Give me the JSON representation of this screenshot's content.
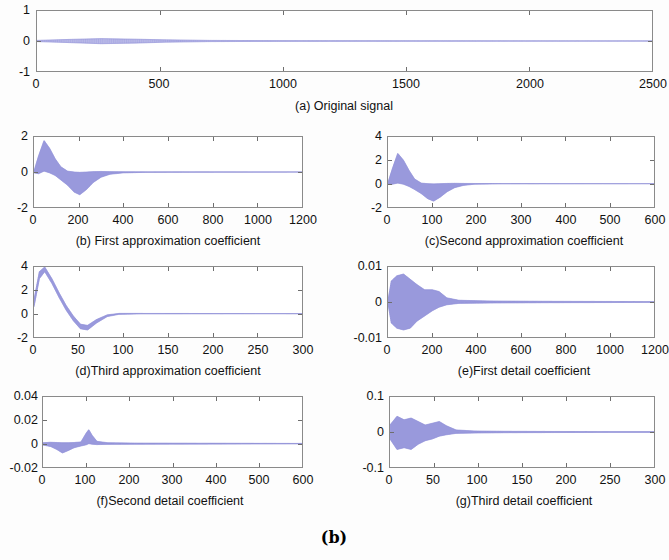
{
  "figure": {
    "panel_letter": "(b)",
    "trace_color": "#8f8fd8",
    "axis_color": "#8a8a8a"
  },
  "chart_data": [
    {
      "id": "a",
      "type": "line",
      "title": "(a) Original signal",
      "xlabel": "",
      "ylabel": "",
      "xlim": [
        0,
        2500
      ],
      "ylim": [
        -1,
        1
      ],
      "xticks": [
        0,
        500,
        1000,
        1500,
        2000,
        2500
      ],
      "yticks": [
        -1,
        0,
        1
      ],
      "grid": false,
      "description": "Near-flat low-amplitude signal centred on zero across full record",
      "envelope": [
        {
          "x": 0,
          "hi": 0.02,
          "lo": -0.02
        },
        {
          "x": 120,
          "hi": 0.05,
          "lo": -0.05
        },
        {
          "x": 260,
          "hi": 0.08,
          "lo": -0.09
        },
        {
          "x": 400,
          "hi": 0.06,
          "lo": -0.07
        },
        {
          "x": 520,
          "hi": 0.04,
          "lo": -0.04
        },
        {
          "x": 700,
          "hi": 0.02,
          "lo": -0.02
        },
        {
          "x": 1000,
          "hi": 0.012,
          "lo": -0.012
        },
        {
          "x": 1500,
          "hi": 0.008,
          "lo": -0.008
        },
        {
          "x": 2000,
          "hi": 0.005,
          "lo": -0.005
        },
        {
          "x": 2500,
          "hi": 0.003,
          "lo": -0.003
        }
      ]
    },
    {
      "id": "b",
      "type": "line",
      "title": "(b) First approximation coefficient",
      "xlabel": "",
      "ylabel": "",
      "xlim": [
        0,
        1200
      ],
      "ylim": [
        -2,
        2
      ],
      "xticks": [
        0,
        200,
        400,
        600,
        800,
        1000,
        1200
      ],
      "yticks": [
        -2,
        0,
        2
      ],
      "grid": false,
      "description": "Dense oscillation: positive lobe peaking near 1.8 around x=50, negative lobe reaching -1.3 near x=200, decaying to zero past x=350",
      "envelope": [
        {
          "x": 0,
          "hi": 0.05,
          "lo": -0.05
        },
        {
          "x": 20,
          "hi": 0.9,
          "lo": -0.1
        },
        {
          "x": 45,
          "hi": 1.8,
          "lo": 0.05
        },
        {
          "x": 70,
          "hi": 1.35,
          "lo": -0.05
        },
        {
          "x": 95,
          "hi": 0.75,
          "lo": -0.2
        },
        {
          "x": 120,
          "hi": 0.3,
          "lo": -0.45
        },
        {
          "x": 150,
          "hi": 0.05,
          "lo": -0.75
        },
        {
          "x": 180,
          "hi": 0.0,
          "lo": -1.15
        },
        {
          "x": 205,
          "hi": -0.02,
          "lo": -1.3
        },
        {
          "x": 235,
          "hi": 0.0,
          "lo": -1.0
        },
        {
          "x": 265,
          "hi": 0.02,
          "lo": -0.6
        },
        {
          "x": 300,
          "hi": 0.03,
          "lo": -0.3
        },
        {
          "x": 340,
          "hi": 0.02,
          "lo": -0.13
        },
        {
          "x": 400,
          "hi": 0.015,
          "lo": -0.05
        },
        {
          "x": 500,
          "hi": 0.01,
          "lo": -0.02
        },
        {
          "x": 700,
          "hi": 0.008,
          "lo": -0.012
        },
        {
          "x": 1000,
          "hi": 0.005,
          "lo": -0.008
        },
        {
          "x": 1200,
          "hi": 0.004,
          "lo": -0.005
        }
      ]
    },
    {
      "id": "c",
      "type": "line",
      "title": "(c)Second approximation coefficient",
      "xlabel": "",
      "ylabel": "",
      "xlim": [
        0,
        600
      ],
      "ylim": [
        -2,
        4
      ],
      "xticks": [
        0,
        100,
        200,
        300,
        400,
        500,
        600
      ],
      "yticks": [
        -2,
        0,
        2,
        4
      ],
      "grid": false,
      "description": "Dense oscillation: positive lobe peaking near 2.6 around x=25, negative lobe reaching -1.5 near x=100, decaying to zero past x=190",
      "envelope": [
        {
          "x": 0,
          "hi": 0.1,
          "lo": -0.05
        },
        {
          "x": 10,
          "hi": 1.3,
          "lo": -0.05
        },
        {
          "x": 22,
          "hi": 2.6,
          "lo": 0.05
        },
        {
          "x": 35,
          "hi": 2.0,
          "lo": -0.05
        },
        {
          "x": 48,
          "hi": 1.1,
          "lo": -0.25
        },
        {
          "x": 60,
          "hi": 0.4,
          "lo": -0.5
        },
        {
          "x": 75,
          "hi": 0.05,
          "lo": -0.85
        },
        {
          "x": 90,
          "hi": 0.0,
          "lo": -1.3
        },
        {
          "x": 103,
          "hi": -0.02,
          "lo": -1.5
        },
        {
          "x": 118,
          "hi": 0.0,
          "lo": -1.15
        },
        {
          "x": 133,
          "hi": 0.02,
          "lo": -0.7
        },
        {
          "x": 150,
          "hi": 0.03,
          "lo": -0.35
        },
        {
          "x": 170,
          "hi": 0.02,
          "lo": -0.15
        },
        {
          "x": 195,
          "hi": 0.015,
          "lo": -0.05
        },
        {
          "x": 250,
          "hi": 0.01,
          "lo": -0.02
        },
        {
          "x": 350,
          "hi": 0.008,
          "lo": -0.012
        },
        {
          "x": 500,
          "hi": 0.005,
          "lo": -0.008
        },
        {
          "x": 600,
          "hi": 0.004,
          "lo": -0.005
        }
      ]
    },
    {
      "id": "d",
      "type": "line",
      "title": "(d)Third approximation coefficient",
      "xlabel": "",
      "ylabel": "",
      "xlim": [
        0,
        300
      ],
      "ylim": [
        -2,
        4
      ],
      "xticks": [
        0,
        50,
        100,
        150,
        200,
        250,
        300
      ],
      "yticks": [
        -2,
        0,
        2,
        4
      ],
      "grid": false,
      "description": "Single large lobe rising off the top of the axis near x=10 then decaying through zero near x=40 to a shallow minimum, flat afterwards",
      "envelope": [
        {
          "x": 0,
          "hi": 1.2,
          "lo": 0.6
        },
        {
          "x": 6,
          "hi": 3.6,
          "lo": 3.0
        },
        {
          "x": 12,
          "hi": 4.0,
          "lo": 3.6
        },
        {
          "x": 20,
          "hi": 3.0,
          "lo": 2.6
        },
        {
          "x": 28,
          "hi": 1.8,
          "lo": 1.4
        },
        {
          "x": 36,
          "hi": 0.7,
          "lo": 0.3
        },
        {
          "x": 44,
          "hi": -0.2,
          "lo": -0.6
        },
        {
          "x": 52,
          "hi": -0.9,
          "lo": -1.3
        },
        {
          "x": 60,
          "hi": -1.0,
          "lo": -1.4
        },
        {
          "x": 70,
          "hi": -0.5,
          "lo": -0.8
        },
        {
          "x": 82,
          "hi": -0.1,
          "lo": -0.25
        },
        {
          "x": 95,
          "hi": 0.02,
          "lo": -0.06
        },
        {
          "x": 120,
          "hi": 0.02,
          "lo": -0.02
        },
        {
          "x": 180,
          "hi": 0.015,
          "lo": -0.015
        },
        {
          "x": 250,
          "hi": 0.01,
          "lo": -0.01
        },
        {
          "x": 300,
          "hi": 0.008,
          "lo": -0.008
        }
      ]
    },
    {
      "id": "e",
      "type": "line",
      "title": "(e)First detail coefficient",
      "xlabel": "",
      "ylabel": "",
      "xlim": [
        0,
        1200
      ],
      "ylim": [
        -0.01,
        0.01
      ],
      "xticks": [
        0,
        200,
        400,
        600,
        800,
        1000,
        1200
      ],
      "yticks": [
        -0.01,
        0,
        0.01
      ],
      "grid": false,
      "description": "Faint high-frequency burst confined to roughly x<260, amplitude up to about 0.008, flat zero thereafter",
      "envelope": [
        {
          "x": 0,
          "hi": 0.0005,
          "lo": -0.0005
        },
        {
          "x": 15,
          "hi": 0.006,
          "lo": -0.006
        },
        {
          "x": 40,
          "hi": 0.0075,
          "lo": -0.0075
        },
        {
          "x": 70,
          "hi": 0.008,
          "lo": -0.008
        },
        {
          "x": 100,
          "hi": 0.0065,
          "lo": -0.0075
        },
        {
          "x": 130,
          "hi": 0.005,
          "lo": -0.0055
        },
        {
          "x": 165,
          "hi": 0.0035,
          "lo": -0.004
        },
        {
          "x": 200,
          "hi": 0.0035,
          "lo": -0.0025
        },
        {
          "x": 230,
          "hi": 0.003,
          "lo": -0.0015
        },
        {
          "x": 265,
          "hi": 0.0012,
          "lo": -0.0008
        },
        {
          "x": 320,
          "hi": 0.0005,
          "lo": -0.0004
        },
        {
          "x": 450,
          "hi": 0.0003,
          "lo": -0.0003
        },
        {
          "x": 700,
          "hi": 0.0002,
          "lo": -0.0002
        },
        {
          "x": 1000,
          "hi": 0.00015,
          "lo": -0.00015
        },
        {
          "x": 1200,
          "hi": 0.0001,
          "lo": -0.0001
        }
      ]
    },
    {
      "id": "f",
      "type": "line",
      "title": "(f)Second detail coefficient",
      "xlabel": "",
      "ylabel": "",
      "xlim": [
        0,
        600
      ],
      "ylim": [
        -0.02,
        0.04
      ],
      "xticks": [
        0,
        100,
        200,
        300,
        400,
        500,
        600
      ],
      "yticks": [
        -0.02,
        0,
        0.02,
        0.04
      ],
      "grid": false,
      "description": "Small negative excursion near x=45 reaching about -0.008 and a narrow positive spike near x=105 reaching about 0.012, flat zero elsewhere",
      "envelope": [
        {
          "x": 0,
          "hi": 0.0008,
          "lo": -0.0012
        },
        {
          "x": 18,
          "hi": 0.0012,
          "lo": -0.0025
        },
        {
          "x": 32,
          "hi": 0.001,
          "lo": -0.005
        },
        {
          "x": 45,
          "hi": 0.0008,
          "lo": -0.008
        },
        {
          "x": 58,
          "hi": 0.0008,
          "lo": -0.006
        },
        {
          "x": 72,
          "hi": 0.001,
          "lo": -0.0035
        },
        {
          "x": 88,
          "hi": 0.0015,
          "lo": -0.002
        },
        {
          "x": 100,
          "hi": 0.009,
          "lo": -0.001
        },
        {
          "x": 106,
          "hi": 0.012,
          "lo": 0.0
        },
        {
          "x": 114,
          "hi": 0.007,
          "lo": -0.0005
        },
        {
          "x": 125,
          "hi": 0.002,
          "lo": -0.0008
        },
        {
          "x": 150,
          "hi": 0.0008,
          "lo": -0.0006
        },
        {
          "x": 220,
          "hi": 0.0005,
          "lo": -0.0005
        },
        {
          "x": 350,
          "hi": 0.0004,
          "lo": -0.0004
        },
        {
          "x": 480,
          "hi": 0.0003,
          "lo": -0.0003
        },
        {
          "x": 600,
          "hi": 0.0002,
          "lo": -0.0002
        }
      ]
    },
    {
      "id": "g",
      "type": "line",
      "title": "(g)Third detail coefficient",
      "xlabel": "",
      "ylabel": "",
      "xlim": [
        0,
        300
      ],
      "ylim": [
        -0.1,
        0.1
      ],
      "xticks": [
        0,
        50,
        100,
        150,
        200,
        250,
        300
      ],
      "yticks": [
        -0.1,
        0,
        0.1
      ],
      "grid": false,
      "description": "Faint oscillatory burst confined to roughly x<70 with amplitude up to about 0.05, essentially flat zero beyond",
      "envelope": [
        {
          "x": 0,
          "hi": 0.02,
          "lo": -0.02
        },
        {
          "x": 8,
          "hi": 0.045,
          "lo": -0.05
        },
        {
          "x": 16,
          "hi": 0.035,
          "lo": -0.045
        },
        {
          "x": 24,
          "hi": 0.04,
          "lo": -0.05
        },
        {
          "x": 32,
          "hi": 0.03,
          "lo": -0.035
        },
        {
          "x": 40,
          "hi": 0.02,
          "lo": -0.025
        },
        {
          "x": 48,
          "hi": 0.025,
          "lo": -0.02
        },
        {
          "x": 56,
          "hi": 0.03,
          "lo": -0.012
        },
        {
          "x": 64,
          "hi": 0.018,
          "lo": -0.008
        },
        {
          "x": 75,
          "hi": 0.006,
          "lo": -0.004
        },
        {
          "x": 95,
          "hi": 0.003,
          "lo": -0.003
        },
        {
          "x": 130,
          "hi": 0.002,
          "lo": -0.002
        },
        {
          "x": 190,
          "hi": 0.0015,
          "lo": -0.0015
        },
        {
          "x": 250,
          "hi": 0.001,
          "lo": -0.001
        },
        {
          "x": 300,
          "hi": 0.001,
          "lo": -0.001
        }
      ]
    }
  ]
}
